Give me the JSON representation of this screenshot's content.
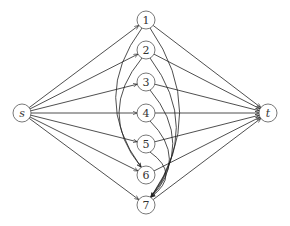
{
  "diagram": {
    "type": "directed-graph",
    "nodes": [
      {
        "id": "s",
        "label": "s",
        "x": 22,
        "y": 113,
        "italic": true
      },
      {
        "id": "1",
        "label": "1",
        "x": 146,
        "y": 20
      },
      {
        "id": "2",
        "label": "2",
        "x": 146,
        "y": 50
      },
      {
        "id": "3",
        "label": "3",
        "x": 146,
        "y": 82
      },
      {
        "id": "4",
        "label": "4",
        "x": 146,
        "y": 113
      },
      {
        "id": "5",
        "label": "5",
        "x": 146,
        "y": 144
      },
      {
        "id": "6",
        "label": "6",
        "x": 146,
        "y": 175
      },
      {
        "id": "7",
        "label": "7",
        "x": 146,
        "y": 205
      },
      {
        "id": "t",
        "label": "t",
        "x": 268,
        "y": 113,
        "italic": true
      }
    ],
    "edges": [
      {
        "from": "s",
        "to": "1"
      },
      {
        "from": "s",
        "to": "2"
      },
      {
        "from": "s",
        "to": "3"
      },
      {
        "from": "s",
        "to": "4"
      },
      {
        "from": "s",
        "to": "5"
      },
      {
        "from": "s",
        "to": "6"
      },
      {
        "from": "s",
        "to": "7"
      },
      {
        "from": "1",
        "to": "t"
      },
      {
        "from": "2",
        "to": "t"
      },
      {
        "from": "3",
        "to": "t"
      },
      {
        "from": "4",
        "to": "t"
      },
      {
        "from": "5",
        "to": "t"
      },
      {
        "from": "6",
        "to": "t"
      },
      {
        "from": "7",
        "to": "t"
      },
      {
        "from": "1",
        "to": "6",
        "curved": "left"
      },
      {
        "from": "2",
        "to": "6",
        "curved": "left"
      },
      {
        "from": "1",
        "to": "7",
        "curved": "right"
      },
      {
        "from": "2",
        "to": "7",
        "curved": "right"
      },
      {
        "from": "3",
        "to": "7",
        "curved": "right"
      },
      {
        "from": "4",
        "to": "7",
        "curved": "right"
      },
      {
        "from": "5",
        "to": "7",
        "curved": "right"
      }
    ],
    "node_radius": 9
  }
}
